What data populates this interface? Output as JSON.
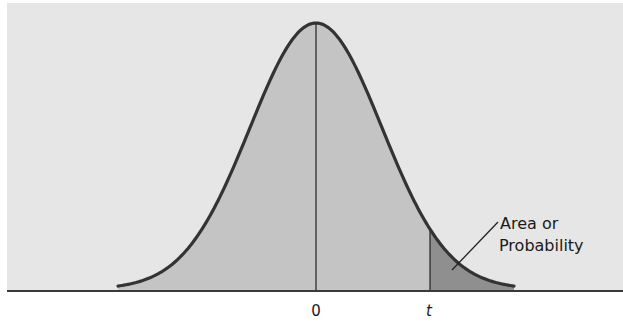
{
  "diagram": {
    "type": "t-distribution upper-tail area",
    "colors": {
      "panel": "#e6e6e6",
      "under_curve": "#c4c4c4",
      "tail": "#8f8f8f",
      "curve": "#333333",
      "axis": "#3a3a3a"
    },
    "annotation": {
      "line1": "Area or",
      "line2": "Probability"
    },
    "ticks": {
      "center": "0",
      "critical": "t"
    }
  },
  "chart_data": {
    "type": "area",
    "title": "",
    "xlabel": "",
    "ylabel": "",
    "distribution": "bell-shaped (t) density, centered at 0",
    "tick_labels": [
      "0",
      "t"
    ],
    "shaded_region": "right tail beyond t",
    "annotation": "Area or Probability",
    "grid": false,
    "legend": null
  }
}
